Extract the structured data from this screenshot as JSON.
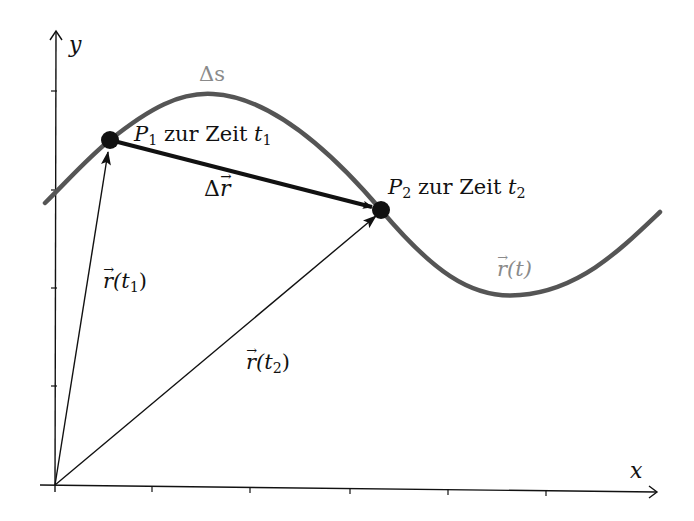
{
  "axes": {
    "x_label": "x",
    "y_label": "y",
    "origin_px": [
      55,
      485
    ],
    "x_ticks_px": [
      152,
      250,
      350,
      448,
      546
    ],
    "y_ticks_px": [
      91,
      190,
      288,
      386
    ]
  },
  "curve": {
    "label_symbol": "r",
    "label_arg": "(t)",
    "color": "#555555",
    "path_points_px": [
      [
        45,
        203
      ],
      [
        110,
        140
      ],
      [
        213,
        94
      ],
      [
        381,
        210
      ],
      [
        520,
        295
      ],
      [
        660,
        212
      ]
    ]
  },
  "arc_label": "Δs",
  "points": [
    {
      "name": "P",
      "sub": "1",
      "text": " zur Zeit ",
      "t": "t",
      "t_sub": "1",
      "px": [
        110,
        140
      ]
    },
    {
      "name": "P",
      "sub": "2",
      "text": " zur Zeit ",
      "t": "t",
      "t_sub": "2",
      "px": [
        381,
        210
      ]
    }
  ],
  "vectors": {
    "r1": {
      "symbol": "r",
      "arg_open": "(t",
      "sub": "1",
      "arg_close": ")"
    },
    "r2": {
      "symbol": "r",
      "arg_open": "(t",
      "sub": "2",
      "arg_close": ")"
    },
    "delta_r": {
      "prefix": "Δ",
      "symbol": "r"
    }
  },
  "colors": {
    "ink": "#111111",
    "curve": "#555555",
    "curve_label": "#8a8a8a"
  }
}
